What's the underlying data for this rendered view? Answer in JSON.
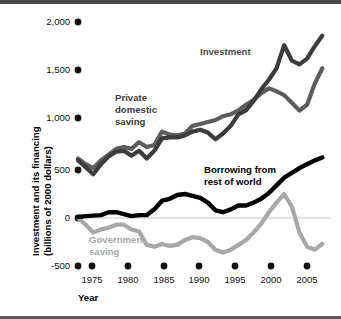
{
  "chart_data": {
    "type": "line",
    "title": "",
    "xlabel": "Year",
    "ylabel": "Investment and its financing (billions of 2000 dollars)",
    "ylabel_line1": "Investment and its financing",
    "ylabel_line2": "(billions of 2000 dollars)",
    "xlim": [
      1973,
      2006
    ],
    "ylim": [
      -500,
      2000
    ],
    "grid": false,
    "zero_line": true,
    "legend_position": "inline-annotations",
    "ytick_labels": [
      "2,000",
      "1,500",
      "1,000",
      "500",
      "0",
      "-500"
    ],
    "ytick_values": [
      2000,
      1500,
      1000,
      500,
      0,
      -500
    ],
    "xtick_labels": [
      "1975",
      "1980",
      "1985",
      "1990",
      "1995",
      "2000",
      "2005"
    ],
    "xtick_values": [
      1975,
      1980,
      1985,
      1990,
      1995,
      2000,
      2005
    ],
    "colors": {
      "investment": "#3c3c3c",
      "private_domestic_saving": "#5d5d5d",
      "borrowing_from_rest_of_world": "#000000",
      "government_saving": "#a8a8a8",
      "zero_line": "#c9c9c9",
      "text": "#111111"
    },
    "x": [
      1973,
      1974,
      1975,
      1976,
      1977,
      1978,
      1979,
      1980,
      1981,
      1982,
      1983,
      1984,
      1985,
      1986,
      1987,
      1988,
      1989,
      1990,
      1991,
      1992,
      1993,
      1994,
      1995,
      1996,
      1997,
      1998,
      1999,
      2000,
      2001,
      2002,
      2003,
      2004,
      2005
    ],
    "series": [
      {
        "name": "Investment",
        "label": "Investment",
        "color": "#3c3c3c",
        "values": [
          600,
          530,
          455,
          560,
          640,
          690,
          700,
          650,
          700,
          620,
          700,
          830,
          840,
          840,
          860,
          900,
          920,
          890,
          820,
          880,
          960,
          1080,
          1120,
          1220,
          1340,
          1440,
          1560,
          1800,
          1640,
          1600,
          1660,
          1790,
          1900
        ]
      },
      {
        "name": "Private domestic saving",
        "label": "Private domestic saving",
        "color": "#5d5d5d",
        "values": [
          620,
          560,
          520,
          600,
          660,
          720,
          740,
          720,
          790,
          740,
          760,
          900,
          870,
          860,
          880,
          960,
          980,
          1000,
          1020,
          1060,
          1080,
          1120,
          1180,
          1230,
          1300,
          1350,
          1320,
          1280,
          1200,
          1120,
          1180,
          1400,
          1560
        ]
      },
      {
        "name": "Borrowing from rest of world",
        "label": "Borrowing from rest of world",
        "color": "#000000",
        "values": [
          10,
          20,
          25,
          30,
          60,
          60,
          40,
          20,
          30,
          30,
          90,
          180,
          200,
          240,
          250,
          230,
          210,
          160,
          80,
          60,
          90,
          130,
          130,
          160,
          200,
          260,
          340,
          420,
          470,
          520,
          560,
          600,
          630
        ]
      },
      {
        "name": "Government saving",
        "label": "Government saving",
        "color": "#a8a8a8",
        "values": [
          0,
          -70,
          -150,
          -120,
          -100,
          -70,
          -70,
          -120,
          -140,
          -280,
          -300,
          -270,
          -290,
          -280,
          -230,
          -200,
          -210,
          -250,
          -330,
          -360,
          -330,
          -280,
          -230,
          -150,
          -60,
          60,
          160,
          250,
          120,
          -150,
          -300,
          -330,
          -270
        ]
      }
    ],
    "annotations": [
      {
        "name": "investment",
        "text": "Investment",
        "color": "#4b4b4b"
      },
      {
        "name": "private-domestic-saving",
        "text_line1": "Private",
        "text_line2": "domestic",
        "text_line3": "saving",
        "color": "#3c3c3c"
      },
      {
        "name": "borrowing-from-rest-of-world",
        "text_line1": "Borrowing from",
        "text_line2": "rest of world",
        "color": "#000000"
      },
      {
        "name": "government-saving",
        "text_line1": "Government",
        "text_line2": "saving",
        "color": "#a8a8a8"
      }
    ]
  }
}
